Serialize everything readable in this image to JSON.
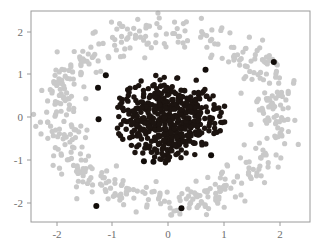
{
  "chart_data": {
    "type": "scatter",
    "title": "",
    "xlabel": "",
    "ylabel": "",
    "xlim": [
      -2.55,
      2.35
    ],
    "ylim": [
      -2.5,
      2.45
    ],
    "grid": false,
    "legend": null,
    "xticks": [
      -2,
      -1,
      0,
      1,
      2
    ],
    "xticklabels": [
      "-2",
      "-1",
      "0",
      "1",
      "2"
    ],
    "yticks": [
      -2,
      -1,
      0,
      1,
      2
    ],
    "yticklabels": [
      "-2",
      "-1",
      "0",
      "1",
      "2"
    ],
    "series": [
      {
        "name": "outer-ring",
        "color": "#c9c9c9",
        "marker": "circle",
        "marker_size": 5.2,
        "shape": "annulus",
        "center": [
          -0.02,
          0.03
        ],
        "radius_mean": 1.98,
        "radius_sigma": 0.19,
        "n_points": 500
      },
      {
        "name": "inner-cluster",
        "color": "#1c1410",
        "marker": "circle",
        "marker_size": 5.4,
        "shape": "disk",
        "center": [
          0.0,
          -0.03
        ],
        "radius_mean": 0.52,
        "radius_sigma": 0.26,
        "n_points": 500
      },
      {
        "name": "dark-outliers",
        "color": "#120d0a",
        "marker": "circle",
        "marker_size": 6.0,
        "shape": "points",
        "points": [
          [
            -1.11,
            0.97
          ],
          [
            -1.25,
            0.68
          ],
          [
            -1.24,
            -0.05
          ],
          [
            -1.28,
            -2.07
          ],
          [
            0.24,
            -2.12
          ],
          [
            0.67,
            1.1
          ],
          [
            1.89,
            1.28
          ],
          [
            0.77,
            -0.89
          ],
          [
            -0.43,
            -1.03
          ],
          [
            -0.26,
            -1.04
          ]
        ],
        "n_points": 10
      }
    ],
    "axes_box": {
      "left_px": 31,
      "top_px": 11,
      "right_px": 310,
      "bottom_px": 222,
      "x_px_at": {
        "-2": 57,
        "-1": 112,
        "0": 168,
        "1": 224,
        "2": 280
      },
      "y_px_at": {
        "2": 32,
        "1": 74,
        "0": 117,
        "-1": 160,
        "-2": 203
      }
    }
  },
  "colors": {
    "background": "#ffffff",
    "axes_border": "#9a9a9a",
    "tick_color": "#9a9a9a",
    "tick_label": "#6e6e6e",
    "inner_cluster": "#1c1410",
    "outer_ring": "#c9c9c9",
    "outlier": "#120d0a"
  }
}
